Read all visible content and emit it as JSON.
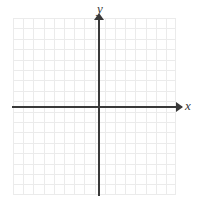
{
  "figure": {
    "type": "coordinate-plane",
    "title": "",
    "background_color": "#ffffff"
  },
  "colors": {
    "axis": "#3a3a3a",
    "grid": "#ebebeb",
    "background": "#ffffff"
  },
  "axes": {
    "x": {
      "label": "x",
      "label_style": "italic",
      "arrow": "right",
      "orientation": "horizontal"
    },
    "y": {
      "label": "y",
      "label_style": "italic",
      "arrow": "up",
      "orientation": "vertical"
    }
  },
  "grid": {
    "visible": true,
    "columns": 16,
    "rows": 17,
    "cell_size_px": 10.2,
    "tick_labels": [],
    "numbers_shown": false
  },
  "chart_data": {
    "type": "scatter",
    "title": "",
    "subtitle": "",
    "xlabel": "x",
    "ylabel": "y",
    "series": [],
    "x": [],
    "y": [],
    "xlim": [
      -9,
      7
    ],
    "ylim": [
      -9,
      8
    ],
    "grid": true,
    "legend": "none",
    "annotations": [],
    "xticks": [],
    "yticks": []
  }
}
